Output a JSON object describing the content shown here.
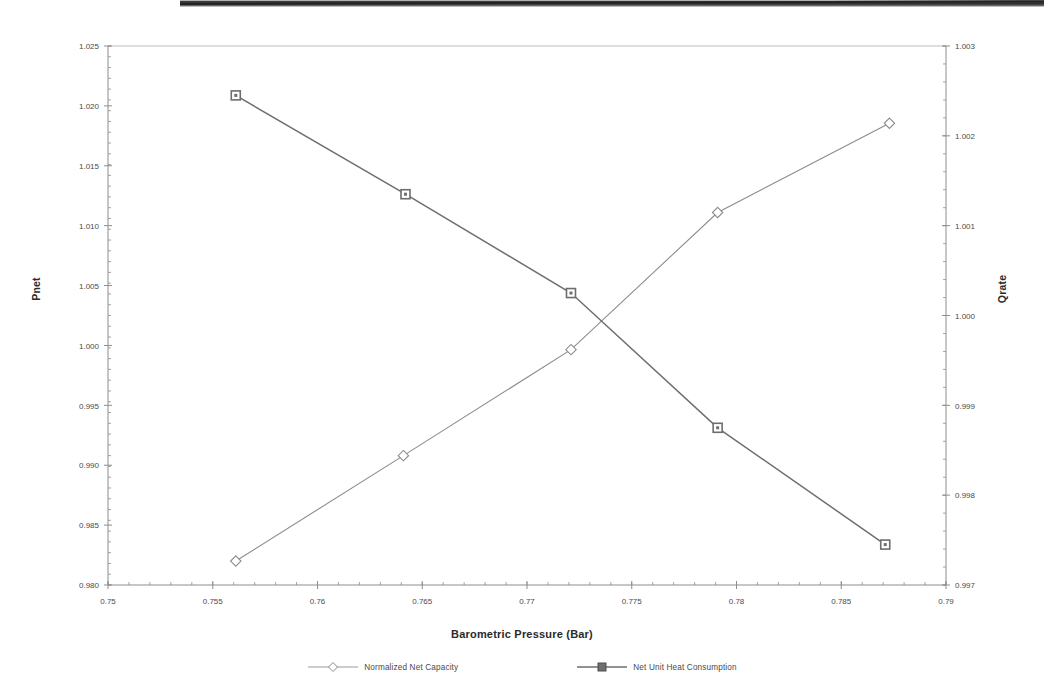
{
  "figure": {
    "x_axis_title": "Barometric Pressure (Bar)",
    "y_axis_left_title": "Pnet",
    "y_axis_right_title": "Qrate"
  },
  "legend": {
    "items": [
      {
        "label": "Normalized Net Capacity",
        "marker": "diamond-marker",
        "color": "#8c8c8c"
      },
      {
        "label": "Net Unit Heat Consumption",
        "marker": "square-marker",
        "color": "#6e6e6e"
      }
    ]
  },
  "chart_data": {
    "type": "line",
    "title": "",
    "xlabel": "Barometric Pressure (Bar)",
    "ylabel": "Pnet",
    "y2label": "Qrate",
    "xlim": [
      0.75,
      0.79
    ],
    "ylim": [
      0.98,
      1.025
    ],
    "y2lim": [
      0.997,
      1.003
    ],
    "grid": false,
    "legend_position": "bottom",
    "xticks": [
      "0.75",
      "0.755",
      "0.76",
      "0.765",
      "0.77",
      "0.775",
      "0.78",
      "0.785",
      "0.79"
    ],
    "xtick_values": [
      0.75,
      0.755,
      0.76,
      0.765,
      0.77,
      0.775,
      0.78,
      0.785,
      0.79
    ],
    "yticks": [
      "0.980",
      "0.985",
      "0.990",
      "0.995",
      "1.000",
      "1.005",
      "1.010",
      "1.015",
      "1.020",
      "1.025"
    ],
    "ytick_values": [
      0.98,
      0.985,
      0.99,
      0.995,
      1.0,
      1.005,
      1.01,
      1.015,
      1.02,
      1.025
    ],
    "y2ticks": [
      "0.997",
      "0.998",
      "0.999",
      "1.000",
      "1.001",
      "1.002",
      "1.003"
    ],
    "y2tick_values": [
      0.997,
      0.998,
      0.999,
      1.0,
      1.001,
      1.002,
      1.003
    ],
    "series": [
      {
        "name": "Normalized Net Capacity",
        "axis": "left",
        "marker": "diamond",
        "color": "#8c8c8c",
        "x": [
          0.7561,
          0.7641,
          0.7721,
          0.7791,
          0.7873
        ],
        "y": [
          0.982,
          0.9908,
          0.99965,
          1.0111,
          1.01855
        ]
      },
      {
        "name": "Net Unit Heat Consumption",
        "axis": "right",
        "marker": "square",
        "color": "#6e6e6e",
        "x": [
          0.7561,
          0.7642,
          0.7721,
          0.7791,
          0.7871
        ],
        "y": [
          1.00245,
          1.00135,
          1.00025,
          0.99875,
          0.99745
        ]
      }
    ]
  }
}
